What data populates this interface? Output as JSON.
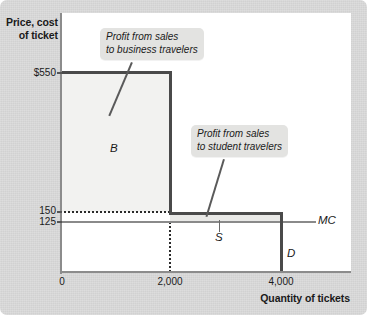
{
  "figure": {
    "y_axis_title": "Price, cost\nof ticket",
    "x_axis_title": "Quantity of tickets"
  },
  "callouts": {
    "business": "Profit from sales\nto business travelers",
    "student": "Profit from sales\nto student travelers"
  },
  "labels": {
    "B": "B",
    "S": "S",
    "MC": "MC",
    "D": "D"
  },
  "ticks": {
    "y": [
      "$550",
      "150",
      "125"
    ],
    "x": [
      "0",
      "2,000",
      "4,000"
    ]
  },
  "chart_data": {
    "type": "line",
    "title": "",
    "xlabel": "Quantity of tickets",
    "ylabel": "Price, cost of ticket",
    "xlim": [
      0,
      4600
    ],
    "ylim": [
      0,
      620
    ],
    "grid": false,
    "legend": "inline-curve-labels",
    "x_ticks": [
      0,
      2000,
      4000
    ],
    "x_tick_labels": [
      "0",
      "2,000",
      "4,000"
    ],
    "y_ticks": [
      125,
      150,
      550
    ],
    "y_tick_labels": [
      "125",
      "150",
      "$550"
    ],
    "series": [
      {
        "name": "D",
        "label": "D",
        "type": "step-demand",
        "points": [
          {
            "x": 0,
            "y": 550
          },
          {
            "x": 2000,
            "y": 550
          },
          {
            "x": 2000,
            "y": 150
          },
          {
            "x": 4000,
            "y": 150
          },
          {
            "x": 4000,
            "y": 0
          }
        ]
      },
      {
        "name": "MC",
        "label": "MC",
        "type": "horizontal",
        "value": 125,
        "points": [
          {
            "x": 0,
            "y": 125
          },
          {
            "x": 4400,
            "y": 125
          }
        ]
      }
    ],
    "regions": [
      {
        "name": "B",
        "label": "B",
        "description": "Profit from sales to business travelers",
        "x_range": [
          0,
          2000
        ],
        "y_range": [
          125,
          550
        ]
      },
      {
        "name": "S",
        "label": "S",
        "description": "Profit from sales to student travelers",
        "x_range": [
          2000,
          4000
        ],
        "y_range": [
          125,
          150
        ]
      }
    ],
    "annotations": [
      {
        "text": "Profit from sales to business travelers",
        "points_to_region": "B"
      },
      {
        "text": "Profit from sales to student travelers",
        "points_to_region": "S"
      }
    ],
    "guides": [
      {
        "type": "horizontal-dotted",
        "y": 150,
        "x_range": [
          0,
          2000
        ]
      },
      {
        "type": "vertical-dotted",
        "x": 2000,
        "y_range": [
          0,
          125
        ]
      }
    ]
  }
}
